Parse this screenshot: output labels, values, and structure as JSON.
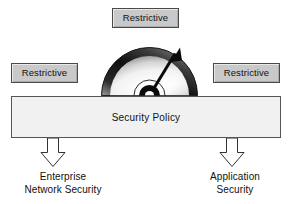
{
  "diagram": {
    "title": "Security Policy",
    "colors": {
      "background": "#ffffff",
      "restrictive_box_fill": "#c9c9c9",
      "restrictive_box_border": "#4a4a4a",
      "policy_bar_fill": "#f1f1f1",
      "policy_bar_border": "#555555",
      "gauge_ring_dark": "#1c1c1c",
      "gauge_face_light": "#ffffff",
      "arrow_fill": "#ffffff",
      "arrow_border": "#333333",
      "text": "#111111"
    }
  },
  "restrictive_labels": {
    "top": "Restrictive",
    "left": "Restrictive",
    "right": "Restrictive"
  },
  "gauge": {
    "icon_name": "gauge-dial",
    "needle_label": "needle",
    "needle_direction": "upper-right",
    "needle_angle_degrees": 58
  },
  "policy_bar": {
    "label": "Security Policy"
  },
  "arrows": [
    {
      "icon_name": "arrow-down-enterprise"
    },
    {
      "icon_name": "arrow-down-application"
    }
  ],
  "outcomes": {
    "enterprise": {
      "line1": "Enterprise",
      "line2": "Network Security"
    },
    "application": {
      "line1": "Application",
      "line2": "Security"
    }
  }
}
